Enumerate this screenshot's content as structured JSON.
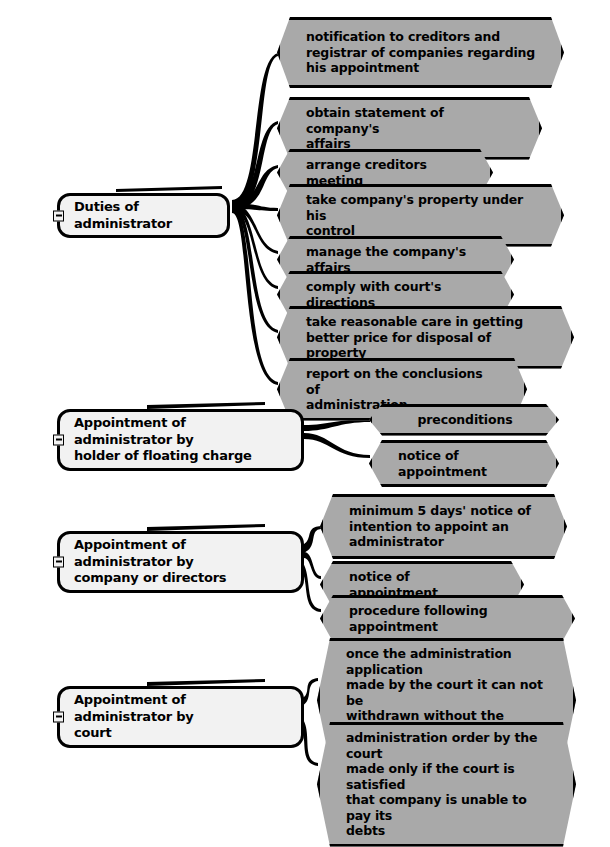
{
  "diagram": {
    "style": {
      "node_fill": "#a9a9a9",
      "parent_fill": "#f2f2f2",
      "stroke": "#000000",
      "text": "#000000",
      "background": "#ffffff"
    },
    "collapse_icon": "minus-box-icon"
  },
  "groups": [
    {
      "id": "duties",
      "parent": {
        "label": "Duties of administrator",
        "collapsed": false,
        "x": 57,
        "y": 193,
        "w": 173,
        "h": 27
      },
      "children": [
        {
          "label": "notification to creditors and\nregistrar of companies regarding\nhis appointment",
          "x": 277,
          "y": 17,
          "w": 287,
          "h": 71
        },
        {
          "label": "obtain statement of company's\naffairs",
          "x": 277,
          "y": 97,
          "w": 265,
          "h": 48
        },
        {
          "label": "arrange creditors meeting",
          "x": 277,
          "y": 149,
          "w": 216,
          "h": 31
        },
        {
          "label": "take company's property under his\ncontrol",
          "x": 277,
          "y": 184,
          "w": 287,
          "h": 48
        },
        {
          "label": "manage the company's affairs",
          "x": 277,
          "y": 236,
          "w": 237,
          "h": 31
        },
        {
          "label": "comply with court's directions",
          "x": 277,
          "y": 271,
          "w": 237,
          "h": 31
        },
        {
          "label": "take reasonable care in getting\nbetter price for disposal of property",
          "x": 277,
          "y": 306,
          "w": 297,
          "h": 48
        },
        {
          "label": "report on the conclusions of\nadministration",
          "x": 277,
          "y": 358,
          "w": 250,
          "h": 48
        }
      ]
    },
    {
      "id": "floating-charge",
      "parent": {
        "label": "Appointment of administrator by\nholder of floating charge",
        "collapsed": false,
        "x": 57,
        "y": 409,
        "w": 247,
        "h": 45
      },
      "children": [
        {
          "label": "preconditions",
          "x": 369,
          "y": 404,
          "w": 190,
          "h": 31
        },
        {
          "label": "notice of appointment",
          "x": 369,
          "y": 440,
          "w": 190,
          "h": 31
        }
      ]
    },
    {
      "id": "company-or-directors",
      "parent": {
        "label": "Appointment of administrator by\ncompany or directors",
        "collapsed": false,
        "x": 57,
        "y": 531,
        "w": 247,
        "h": 45
      },
      "children": [
        {
          "label": "minimum 5 days' notice of\nintention to appoint an\nadministrator",
          "x": 320,
          "y": 494,
          "w": 247,
          "h": 65
        },
        {
          "label": "notice of appointment",
          "x": 320,
          "y": 561,
          "w": 204,
          "h": 31
        },
        {
          "label": "procedure following appointment",
          "x": 320,
          "y": 595,
          "w": 255,
          "h": 31
        }
      ]
    },
    {
      "id": "court",
      "parent": {
        "label": "Appointment of administrator by\ncourt",
        "collapsed": false,
        "x": 57,
        "y": 686,
        "w": 247,
        "h": 45
      },
      "children": [
        {
          "label": "once the administration application\nmade by the court it can not be\nwithdrawn without the permission\nof the court",
          "x": 317,
          "y": 638,
          "w": 259,
          "h": 81
        },
        {
          "label": "administration order by the court\nmade only if the court is satisfied\nthat company is unable to pay its\ndebts",
          "x": 317,
          "y": 722,
          "w": 259,
          "h": 81
        }
      ]
    }
  ]
}
